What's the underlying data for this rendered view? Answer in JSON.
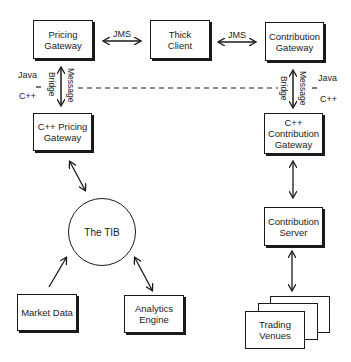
{
  "diagram": {
    "nodes": {
      "pricing_gateway": "Pricing\nGateway",
      "thick_client": "Thick\nClient",
      "contribution_gateway": "Contribution\nGateway",
      "cpp_pricing_gateway": "C++ Pricing\nGateway",
      "cpp_contribution_gateway": "C++\nContribution\nGateway",
      "tib": "The TIB",
      "contribution_server": "Contribution\nServer",
      "market_data": "Market Data",
      "analytics_engine": "Analytics\nEngine",
      "trading_venues": "Trading\nVenues"
    },
    "edge_labels": {
      "jms_left": "JMS",
      "jms_right": "JMS",
      "message_left": "Message",
      "bridge_left": "Bridge",
      "message_right": "Message",
      "bridge_right": "Bridge"
    },
    "layer_labels": {
      "java_left": "Java",
      "cpp_left": "C++",
      "java_right": "Java",
      "cpp_right": "C++"
    }
  }
}
